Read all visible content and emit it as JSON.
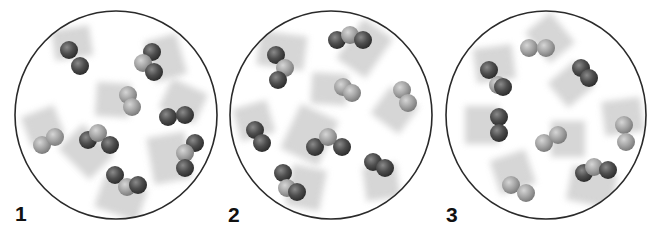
{
  "figure": {
    "colors": {
      "dark_atom": "#4a4a4a",
      "light_atom": "#a9a9a9",
      "outline": "#2a2a2a",
      "trail": "#c8c8c8"
    },
    "panels": [
      {
        "label": "1",
        "cx": 116,
        "cy": 115,
        "rx": 101,
        "ry": 104,
        "label_pos": [
          15,
          203
        ],
        "molecules": [
          {
            "atoms": [
              [
                "d",
                69,
                50
              ],
              [
                "d",
                80,
                66
              ]
            ],
            "trail": [
              -4,
              -26
            ]
          },
          {
            "atoms": [
              [
                "d",
                152,
                52
              ],
              [
                "l",
                143,
                63
              ],
              [
                "d",
                154,
                72
              ]
            ],
            "trail": [
              28,
              -8
            ]
          },
          {
            "atoms": [
              [
                "l",
                128,
                95
              ],
              [
                "l",
                132,
                107
              ]
            ],
            "trail": [
              -30,
              -2
            ]
          },
          {
            "atoms": [
              [
                "d",
                168,
                117
              ],
              [
                "d",
                185,
                115
              ]
            ],
            "trail": [
              12,
              -26
            ]
          },
          {
            "atoms": [
              [
                "l",
                42,
                145
              ],
              [
                "l",
                55,
                137
              ]
            ],
            "trail": [
              -10,
              -26
            ]
          },
          {
            "atoms": [
              [
                "d",
                88,
                140
              ],
              [
                "l",
                98,
                133
              ],
              [
                "d",
                110,
                145
              ]
            ],
            "trail": [
              -22,
              22
            ]
          },
          {
            "atoms": [
              [
                "d",
                195,
                143
              ],
              [
                "l",
                185,
                153
              ],
              [
                "d",
                185,
                168
              ]
            ],
            "trail": [
              -34,
              6
            ]
          },
          {
            "atoms": [
              [
                "d",
                115,
                175
              ],
              [
                "l",
                127,
                187
              ],
              [
                "d",
                138,
                185
              ]
            ],
            "trail": [
              -10,
              28
            ]
          }
        ]
      },
      {
        "label": "2",
        "cx": 331,
        "cy": 115,
        "rx": 101,
        "ry": 104,
        "label_pos": [
          228,
          204
        ],
        "molecules": [
          {
            "atoms": [
              [
                "d",
                276,
                55
              ],
              [
                "l",
                285,
                68
              ],
              [
                "d",
                278,
                80
              ]
            ],
            "trail": [
              4,
              -30
            ]
          },
          {
            "atoms": [
              [
                "d",
                337,
                40
              ],
              [
                "l",
                350,
                35
              ],
              [
                "d",
                363,
                40
              ]
            ],
            "trail": [
              26,
              18
            ]
          },
          {
            "atoms": [
              [
                "l",
                343,
                87
              ],
              [
                "l",
                352,
                93
              ]
            ],
            "trail": [
              -32,
              -2
            ]
          },
          {
            "atoms": [
              [
                "l",
                402,
                90
              ],
              [
                "l",
                408,
                103
              ]
            ],
            "trail": [
              -18,
              24
            ]
          },
          {
            "atoms": [
              [
                "d",
                255,
                130
              ],
              [
                "d",
                262,
                143
              ]
            ],
            "trail": [
              -8,
              -28
            ]
          },
          {
            "atoms": [
              [
                "d",
                315,
                147
              ],
              [
                "l",
                328,
                137
              ],
              [
                "d",
                342,
                147
              ]
            ],
            "trail": [
              -34,
              -16
            ]
          },
          {
            "atoms": [
              [
                "d",
                373,
                162
              ],
              [
                "d",
                385,
                168
              ]
            ],
            "trail": [
              4,
              30
            ]
          },
          {
            "atoms": [
              [
                "d",
                283,
                173
              ],
              [
                "l",
                287,
                188
              ],
              [
                "d",
                297,
                192
              ]
            ],
            "trail": [
              30,
              6
            ]
          }
        ]
      },
      {
        "label": "3",
        "cx": 546,
        "cy": 115,
        "rx": 100,
        "ry": 104,
        "label_pos": [
          446,
          204
        ],
        "molecules": [
          {
            "atoms": [
              [
                "l",
                529,
                48
              ],
              [
                "l",
                546,
                48
              ]
            ],
            "trail": [
              22,
              -18
            ]
          },
          {
            "atoms": [
              [
                "d",
                489,
                70
              ],
              [
                "l",
                498,
                85
              ],
              [
                "d",
                503,
                87
              ]
            ],
            "trail": [
              -4,
              -30
            ]
          },
          {
            "atoms": [
              [
                "d",
                581,
                68
              ],
              [
                "d",
                589,
                78
              ]
            ],
            "trail": [
              -24,
              20
            ]
          },
          {
            "atoms": [
              [
                "d",
                499,
                117
              ],
              [
                "d",
                499,
                133
              ]
            ],
            "trail": [
              -30,
              0
            ]
          },
          {
            "atoms": [
              [
                "l",
                544,
                143
              ],
              [
                "l",
                558,
                135
              ]
            ],
            "trail": [
              30,
              0
            ]
          },
          {
            "atoms": [
              [
                "l",
                624,
                125
              ],
              [
                "l",
                626,
                142
              ]
            ],
            "trail": [
              -4,
              -30
            ]
          },
          {
            "atoms": [
              [
                "l",
                511,
                185
              ],
              [
                "l",
                526,
                193
              ]
            ],
            "trail": [
              -10,
              -30
            ]
          },
          {
            "atoms": [
              [
                "d",
                584,
                173
              ],
              [
                "l",
                594,
                167
              ],
              [
                "d",
                608,
                170
              ]
            ],
            "trail": [
              -6,
              30
            ]
          }
        ]
      }
    ]
  }
}
